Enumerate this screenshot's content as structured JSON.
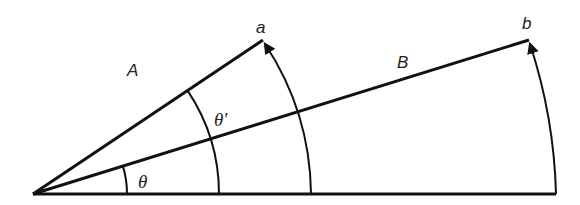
{
  "diagram": {
    "type": "vector-rotation-angles",
    "labels": {
      "vector_a_region": "A",
      "vector_b_region": "B",
      "point_a": "a",
      "point_b": "b",
      "angle_small": "θ",
      "angle_large": "θ′"
    },
    "colors": {
      "stroke": "#111111",
      "text": "#222222",
      "background": "#ffffff"
    }
  }
}
